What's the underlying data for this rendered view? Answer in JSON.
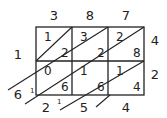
{
  "top_digits": [
    "3",
    "8",
    "7"
  ],
  "right_digits": [
    "4",
    "2"
  ],
  "cells": [
    [
      {
        "tens": "1",
        "ones": "2"
      },
      {
        "tens": "3",
        "ones": "2"
      },
      {
        "tens": "2",
        "ones": "8"
      }
    ],
    [
      {
        "tens": "0",
        "ones": "6"
      },
      {
        "tens": "1",
        "ones": "6"
      },
      {
        "tens": "1",
        "ones": "4"
      }
    ]
  ],
  "result_left": [
    "1",
    "6"
  ],
  "result_bottom": [
    "2",
    "5",
    "4"
  ],
  "carries": {
    "left_6": "1",
    "bottom_2": "1"
  }
}
